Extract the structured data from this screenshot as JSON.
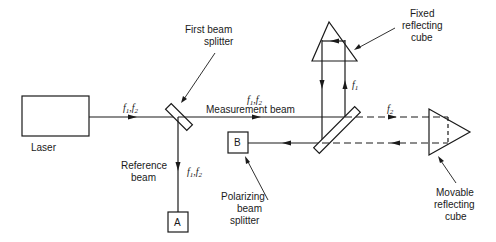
{
  "diagram": {
    "type": "heterodyne laser interferometer schematic",
    "colors": {
      "line": "#1a1a1a",
      "background": "#ffffff"
    },
    "components": {
      "laser": {
        "label": "Laser"
      },
      "first_beam_splitter": {
        "label_line1": "First beam",
        "label_line2": "splitter"
      },
      "polarizing_beam_splitter": {
        "label_line1": "Polarizing",
        "label_line2": "beam",
        "label_line3": "splitter"
      },
      "fixed_cube": {
        "label_line1": "Fixed",
        "label_line2": "reflecting",
        "label_line3": "cube"
      },
      "movable_cube": {
        "label_line1": "Movable",
        "label_line2": "reflecting",
        "label_line3": "cube"
      },
      "detector_a": {
        "label": "A"
      },
      "detector_b": {
        "label": "B"
      }
    },
    "beams": {
      "input": {
        "freq": "f",
        "sub1": "1",
        "sep": ",",
        "sub2": "2"
      },
      "measurement": {
        "label": "Measurement beam",
        "freq": "f",
        "sub1": "1",
        "sep": ",",
        "sub2": "2"
      },
      "reference": {
        "label_line1": "Reference",
        "label_line2": "beam",
        "freq": "f",
        "sub1": "1",
        "sep": ",",
        "sub2": "2"
      },
      "fixed_arm": {
        "freq": "f",
        "sub": "1"
      },
      "movable_arm": {
        "freq": "f",
        "sub": "2"
      }
    }
  }
}
